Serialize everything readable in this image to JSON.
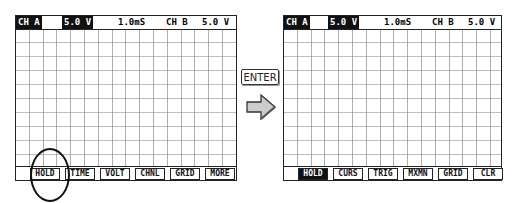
{
  "left_screen": {
    "header": {
      "ch_a_label": "CH A",
      "ch_a_volts": "5.0 V",
      "timebase": "1.0mS",
      "ch_b_label": "CH B",
      "ch_b_volts": "5.0 V"
    },
    "menu": [
      "HOLD",
      "TIME",
      "VOLT",
      "CHNL",
      "GRID",
      "MORE"
    ],
    "highlighted_item": "HOLD"
  },
  "transition": {
    "key_label": "ENTER",
    "arrow_icon": "right-arrow-icon"
  },
  "right_screen": {
    "header": {
      "ch_a_label": "CH A",
      "ch_a_volts": "5.0 V",
      "timebase": "1.0mS",
      "ch_b_label": "CH B",
      "ch_b_volts": "5.0 V"
    },
    "menu": [
      "HOLD",
      "CURS",
      "TRIG",
      "MXMN",
      "GRID",
      "CLR"
    ],
    "active_item": "HOLD"
  }
}
